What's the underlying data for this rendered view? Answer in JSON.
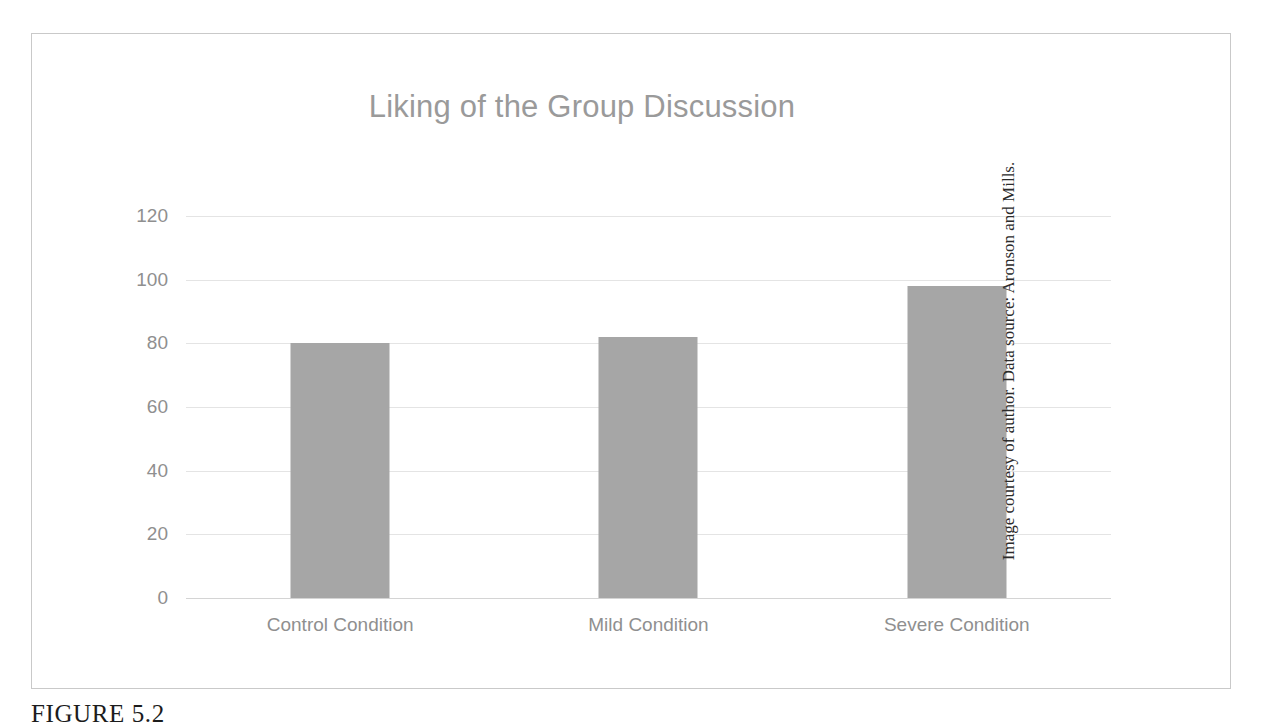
{
  "figure": {
    "caption": "FIGURE 5.2",
    "credit": "Image courtesy of author. Data source: Aronson and Mills.",
    "border_color": "#c9c9c9",
    "background_color": "#ffffff"
  },
  "chart_data": {
    "type": "bar",
    "title": "Liking of the Group Discussion",
    "xlabel": "",
    "ylabel": "",
    "categories": [
      "Control Condition",
      "Mild Condition",
      "Severe Condition"
    ],
    "values": [
      80,
      82,
      98
    ],
    "yticks": [
      0,
      20,
      40,
      60,
      80,
      100,
      120
    ],
    "ytick_labels": [
      "0",
      "20",
      "40",
      "60",
      "80",
      "100",
      "120"
    ],
    "ylim": [
      0,
      120
    ],
    "grid": true,
    "legend": "none",
    "bar_color": "#a6a6a6",
    "gridline_color": "#e4e4e4",
    "axis_color": "#d4d4d4",
    "title_color": "#9a9a9a",
    "tick_label_color": "#8f8f8f"
  }
}
